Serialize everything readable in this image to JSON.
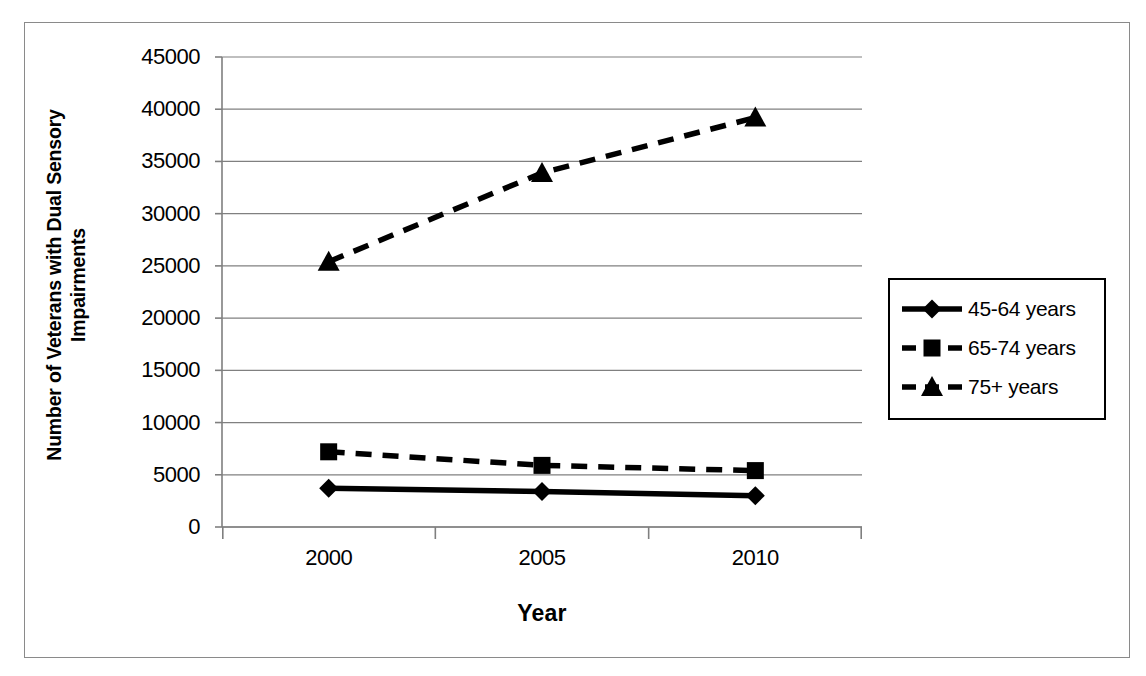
{
  "chart_data": {
    "type": "line",
    "title": "",
    "xlabel": "Year",
    "ylabel": "Number of Veterans with Dual Sensory Impairments",
    "ylabel_line1": "Number of Veterans with Dual Sensory",
    "ylabel_line2": "Impairments",
    "categories": [
      "2000",
      "2005",
      "2010"
    ],
    "ylim": [
      0,
      45000
    ],
    "ytick_step": 5000,
    "yticks": [
      "45000",
      "40000",
      "35000",
      "30000",
      "25000",
      "20000",
      "15000",
      "10000",
      "5000",
      "0"
    ],
    "ytick_values": [
      45000,
      40000,
      35000,
      30000,
      25000,
      20000,
      15000,
      10000,
      5000,
      0
    ],
    "grid": "horizontal",
    "legend_position": "right",
    "series": [
      {
        "name": "45-64 years",
        "values": [
          3700,
          3400,
          3000
        ],
        "marker": "diamond",
        "line_style": "solid",
        "color": "#000000"
      },
      {
        "name": "65-74 years",
        "values": [
          7200,
          5900,
          5400
        ],
        "marker": "square",
        "line_style": "dashed",
        "color": "#000000"
      },
      {
        "name": "75+ years",
        "values": [
          25400,
          33900,
          39200
        ],
        "marker": "triangle",
        "line_style": "dashed",
        "color": "#000000"
      }
    ]
  },
  "colors": {
    "series": "#000000",
    "gridline": "#808080",
    "axis": "#7f7f7f",
    "frame": "#8a8a8a",
    "background": "#ffffff"
  }
}
